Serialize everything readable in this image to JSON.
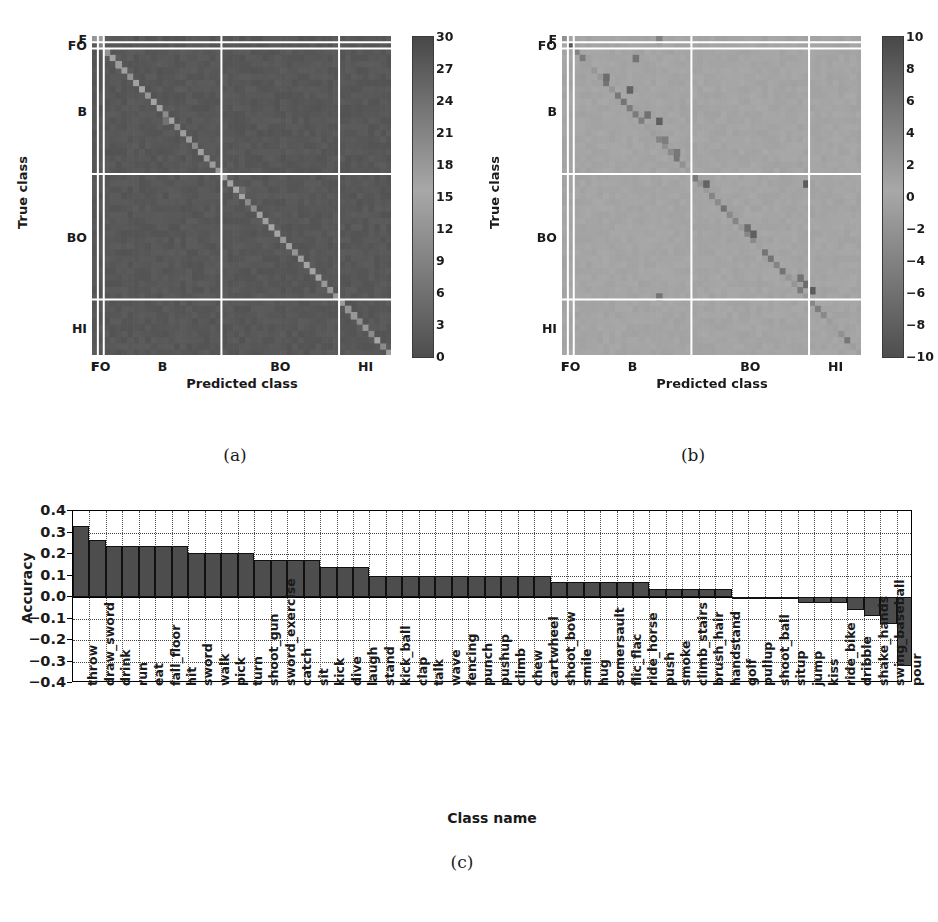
{
  "figure": {
    "captions": {
      "a": "(a)",
      "b": "(b)",
      "c": "(c)"
    }
  },
  "chart_data": [
    {
      "panel": "(a)",
      "type": "heatmap",
      "title": "",
      "xlabel": "Predicted class",
      "ylabel": "True class",
      "xtick_labels": [
        "F",
        "FO",
        "B",
        "BO",
        "HI"
      ],
      "ytick_labels": [
        "F",
        "FO",
        "B",
        "BO",
        "HI"
      ],
      "colorbar": {
        "ticks": [
          30,
          27,
          24,
          21,
          18,
          15,
          12,
          9,
          6,
          3,
          0
        ],
        "vmin": 0,
        "vmax": 30,
        "colormap": "gray-diverging-light-center"
      },
      "grid": true,
      "n_classes": 51,
      "description": "Confusion matrix counts, strong bright diagonal",
      "group_boundaries": [
        1,
        2,
        22,
        42,
        51
      ]
    },
    {
      "panel": "(b)",
      "type": "heatmap",
      "title": "",
      "xlabel": "Predicted class",
      "ylabel": "True class",
      "xtick_labels": [
        "F",
        "FO",
        "B",
        "BO",
        "HI"
      ],
      "ytick_labels": [
        "F",
        "FO",
        "B",
        "BO",
        "HI"
      ],
      "colorbar": {
        "ticks": [
          10,
          8,
          6,
          4,
          2,
          0,
          -2,
          -4,
          -6,
          -8,
          -10
        ],
        "vmin": -10,
        "vmax": 10,
        "colormap": "gray-diverging-light-center"
      },
      "grid": true,
      "n_classes": 51,
      "description": "Difference confusion matrix, dark diagonal spots",
      "group_boundaries": [
        1,
        2,
        22,
        42,
        51
      ]
    },
    {
      "panel": "(c)",
      "type": "bar",
      "title": "",
      "xlabel": "Class name",
      "ylabel": "Accuracy",
      "ylim": [
        -0.4,
        0.4
      ],
      "yticks": [
        0.4,
        0.3,
        0.2,
        0.1,
        0.0,
        -0.1,
        -0.2,
        -0.3,
        -0.4
      ],
      "ytick_labels": [
        "0.4",
        "0.3",
        "0.2",
        "0.1",
        "0.0",
        "−0.1",
        "−0.2",
        "−0.3",
        "−0.4"
      ],
      "grid": true,
      "categories": [
        "throw",
        "draw_sword",
        "drink",
        "run",
        "eat",
        "fall_floor",
        "hit",
        "sword",
        "walk",
        "pick",
        "turn",
        "shoot_gun",
        "sword_exercise",
        "catch",
        "sit",
        "kick",
        "dive",
        "laugh",
        "stand",
        "kick_ball",
        "clap",
        "talk",
        "wave",
        "fencing",
        "punch",
        "pushup",
        "climb",
        "chew",
        "cartwheel",
        "shoot_bow",
        "smile",
        "hug",
        "somersault",
        "flic_flac",
        "ride_horse",
        "push",
        "smoke",
        "climb_stairs",
        "brush_hair",
        "handstand",
        "golf",
        "pullup",
        "shoot_ball",
        "situp",
        "jump",
        "kiss",
        "ride_bike",
        "dribble",
        "shake_hands",
        "swing_baseball",
        "pour"
      ],
      "values": [
        0.33,
        0.265,
        0.235,
        0.235,
        0.235,
        0.235,
        0.235,
        0.205,
        0.205,
        0.205,
        0.205,
        0.17,
        0.17,
        0.17,
        0.17,
        0.14,
        0.14,
        0.14,
        0.1,
        0.1,
        0.1,
        0.1,
        0.1,
        0.1,
        0.1,
        0.1,
        0.1,
        0.1,
        0.1,
        0.07,
        0.07,
        0.07,
        0.07,
        0.07,
        0.07,
        0.035,
        0.035,
        0.035,
        0.035,
        0.035,
        0.0,
        0.0,
        0.0,
        0.0,
        -0.03,
        -0.03,
        -0.03,
        -0.06,
        -0.09,
        -0.125,
        -0.32
      ]
    }
  ]
}
